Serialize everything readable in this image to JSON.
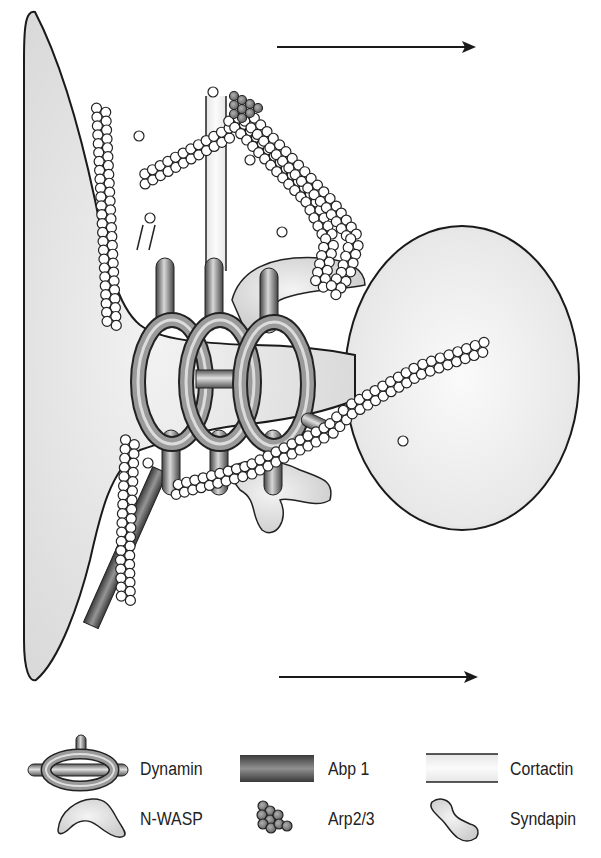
{
  "diagram": {
    "topic": "Dynamin-mediated vesicle fission with actin machinery",
    "arrows": [
      {
        "name": "top-arrow",
        "x1": 277,
        "y1": 47,
        "x2": 476,
        "y2": 47
      },
      {
        "name": "bottom-arrow",
        "x1": 279,
        "y1": 677,
        "x2": 478,
        "y2": 677
      }
    ],
    "colors": {
      "membrane_fill": "#e4e4e4",
      "outline": "#1a1a1a",
      "dynamin": "#7a7a7a",
      "abp1": "#6a6a6a",
      "cortactin": "#eeeeee",
      "arp23": "#8a8a8a",
      "actin_bead": "#ffffff",
      "nwasp": "#e6e6e6",
      "syndapin": "#d6d6d6"
    }
  },
  "legend": {
    "items": [
      {
        "key": "dynamin",
        "label": "Dynamin"
      },
      {
        "key": "abp1",
        "label": "Abp 1"
      },
      {
        "key": "cortactin",
        "label": "Cortactin"
      },
      {
        "key": "nwasp",
        "label": "N-WASP"
      },
      {
        "key": "arp23",
        "label": "Arp2/3"
      },
      {
        "key": "syndapin",
        "label": "Syndapin"
      }
    ]
  }
}
